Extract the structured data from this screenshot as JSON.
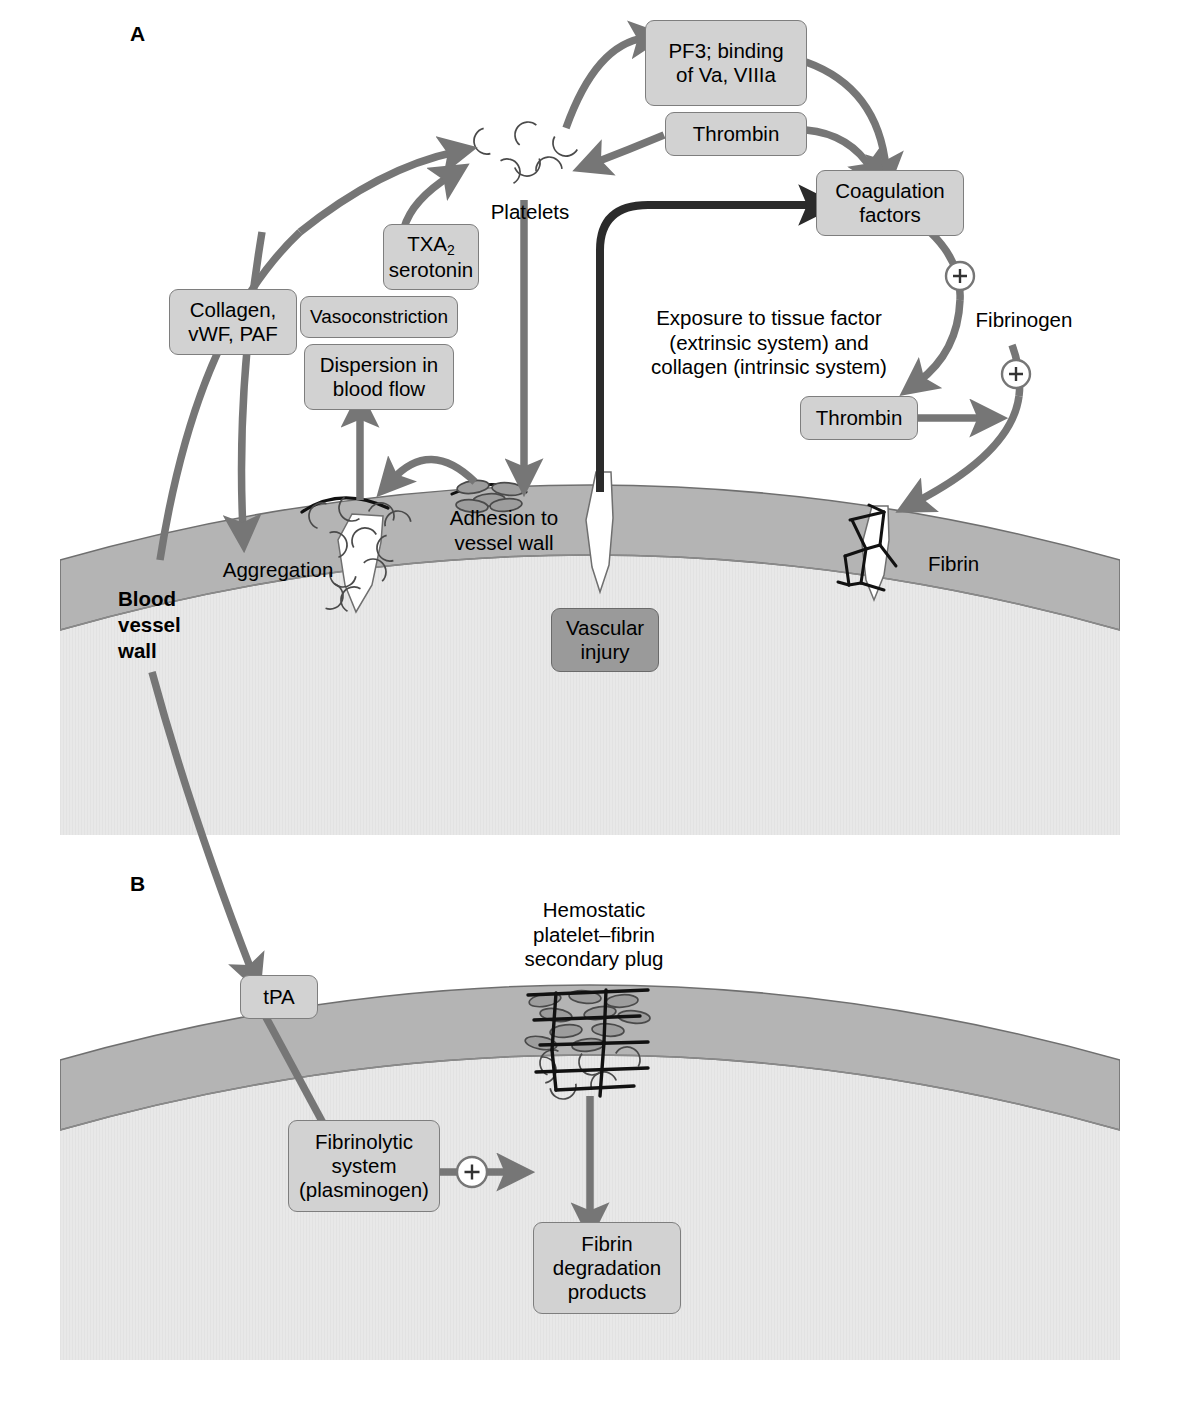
{
  "figure": {
    "panels": [
      {
        "id": "A",
        "label": "A"
      },
      {
        "id": "B",
        "label": "B"
      }
    ]
  },
  "colors": {
    "box_fill": "#d2d2d2",
    "box_border": "#7e7e7e",
    "box_fill_dark": "#9a9a9a",
    "arrow_gray": "#767676",
    "arrow_dark": "#2b2b2b",
    "vessel_wall": "#b4b4b4",
    "vessel_lumen": "#e8e8e8",
    "platelet_fill": "#9d9d9d",
    "platelet_stroke": "#4a4a4a",
    "fibrin_stroke": "#111111",
    "plus_circle_fill": "#ffffff",
    "background": "#ffffff"
  },
  "panelA": {
    "letter": "A",
    "boxes": {
      "pf3": "PF3; binding\nof Va, VIIIa",
      "thrombin_top": "Thrombin",
      "coagulation_factors": "Coagulation\nfactors",
      "txa2_line1": "TXA",
      "txa2_sub": "2",
      "txa2_line2": "serotonin",
      "collagen": "Collagen,\nvWF, PAF",
      "vasoconstriction": "Vasoconstriction",
      "dispersion": "Dispersion in\nblood flow",
      "thrombin_lower": "Thrombin",
      "vascular_injury": "Vascular\ninjury"
    },
    "labels": {
      "platelets": "Platelets",
      "exposure": "Exposure to tissue factor\n(extrinsic system) and\ncollagen (intrinsic system)",
      "fibrinogen": "Fibrinogen",
      "aggregation": "Aggregation",
      "adhesion": "Adhesion to\nvessel wall",
      "blood_vessel_wall": "Blood\nvessel\nwall",
      "fibrin": "Fibrin"
    },
    "plus_signs": [
      "+",
      "+"
    ]
  },
  "panelB": {
    "letter": "B",
    "boxes": {
      "tpa": "tPA",
      "fibrinolytic": "Fibrinolytic\nsystem\n(plasminogen)",
      "fdp": "Fibrin\ndegradation\nproducts"
    },
    "labels": {
      "hemostatic_plug": "Hemostatic\nplatelet–fibrin\nsecondary plug"
    },
    "plus_signs": [
      "+"
    ]
  }
}
